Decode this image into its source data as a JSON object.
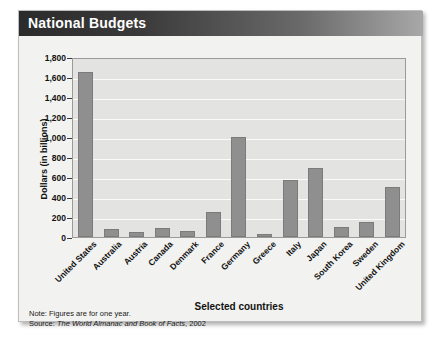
{
  "figure": {
    "title": "National Budgets",
    "footnote_note": "Note: Figures are for one year.",
    "footnote_source_prefix": "Source:",
    "footnote_source_italic": "The World Almanac and Book of Facts",
    "footnote_source_year": ", 2002"
  },
  "colors": {
    "bar_fill": "#8f8f8f",
    "bar_border": "#7b7b7b",
    "plot_background": "#e3e3e1",
    "gridline": "#fbfbfa",
    "title_bar_dark": "#2b2b2b",
    "card_background": "#f2f2f0"
  },
  "chart_data": {
    "type": "bar",
    "title": "National Budgets",
    "xlabel": "Selected countries",
    "ylabel": "Dollars (in billions)",
    "ylim": [
      0,
      1800
    ],
    "ytick_step": 200,
    "ytick_labels": [
      "1,800",
      "1,600",
      "1,400",
      "1,200",
      "1,000",
      "800",
      "600",
      "400",
      "200",
      "0"
    ],
    "ytick_values": [
      1800,
      1600,
      1400,
      1200,
      1000,
      800,
      600,
      400,
      200,
      0
    ],
    "grid": true,
    "legend": null,
    "categories": [
      "United States",
      "Australia",
      "Austria",
      "Canada",
      "Denmark",
      "France",
      "Germany",
      "Greece",
      "Italy",
      "Japan",
      "South Korea",
      "Sweden",
      "United Kingdom"
    ],
    "values": [
      1650,
      85,
      50,
      95,
      60,
      250,
      1000,
      30,
      570,
      690,
      100,
      150,
      500
    ]
  }
}
